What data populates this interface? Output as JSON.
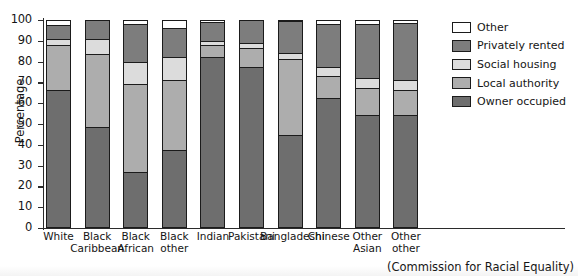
{
  "chart_data": {
    "type": "bar",
    "subtype": "stacked-percentage",
    "title": "",
    "xlabel": "",
    "ylabel": "Percentage",
    "ylim": [
      0,
      100
    ],
    "yticks": [
      0,
      10,
      20,
      30,
      40,
      50,
      60,
      70,
      80,
      90,
      100
    ],
    "grid": false,
    "legend_position": "right",
    "source_note": "(Commission for Racial Equality)",
    "categories": [
      "White",
      "Black Caribbean",
      "Black African",
      "Black other",
      "Indian",
      "Pakistani",
      "Bangladeshi",
      "Chinese",
      "Other Asian",
      "Other other"
    ],
    "category_lines": [
      [
        "White"
      ],
      [
        "Black",
        "Caribbean"
      ],
      [
        "Black",
        "African"
      ],
      [
        "Black",
        "other"
      ],
      [
        "Indian"
      ],
      [
        "Pakistani"
      ],
      [
        "Bangladeshi"
      ],
      [
        "Chinese"
      ],
      [
        "Other",
        "Asian"
      ],
      [
        "Other",
        "other"
      ]
    ],
    "series": [
      {
        "name": "Owner occupied",
        "color": "#6e6e6e",
        "values": [
          66,
          48,
          26,
          37,
          82,
          77,
          44,
          62,
          54,
          54
        ]
      },
      {
        "name": "Local authority",
        "color": "#adadad",
        "values": [
          22,
          35.5,
          43,
          34,
          6,
          9.5,
          37,
          11,
          13,
          12
        ]
      },
      {
        "name": "Social housing",
        "color": "#dcdcdc",
        "values": [
          3,
          7.5,
          10.5,
          11,
          2,
          2.5,
          3,
          4,
          5,
          5
        ]
      },
      {
        "name": "Privately rented",
        "color": "#7d7d7d",
        "values": [
          6.5,
          9,
          18.5,
          14,
          9,
          11,
          15.5,
          21,
          26,
          27.5
        ]
      },
      {
        "name": "Other",
        "color": "#ffffff",
        "values": [
          2.5,
          0,
          2,
          4,
          1,
          0,
          0.5,
          2,
          2,
          1.5
        ]
      }
    ]
  },
  "legend": {
    "entries": [
      {
        "label": "Other",
        "color": "#ffffff"
      },
      {
        "label": "Privately rented",
        "color": "#7d7d7d"
      },
      {
        "label": "Social housing",
        "color": "#dcdcdc"
      },
      {
        "label": "Local authority",
        "color": "#adadad"
      },
      {
        "label": "Owner occupied",
        "color": "#6e6e6e"
      }
    ]
  }
}
